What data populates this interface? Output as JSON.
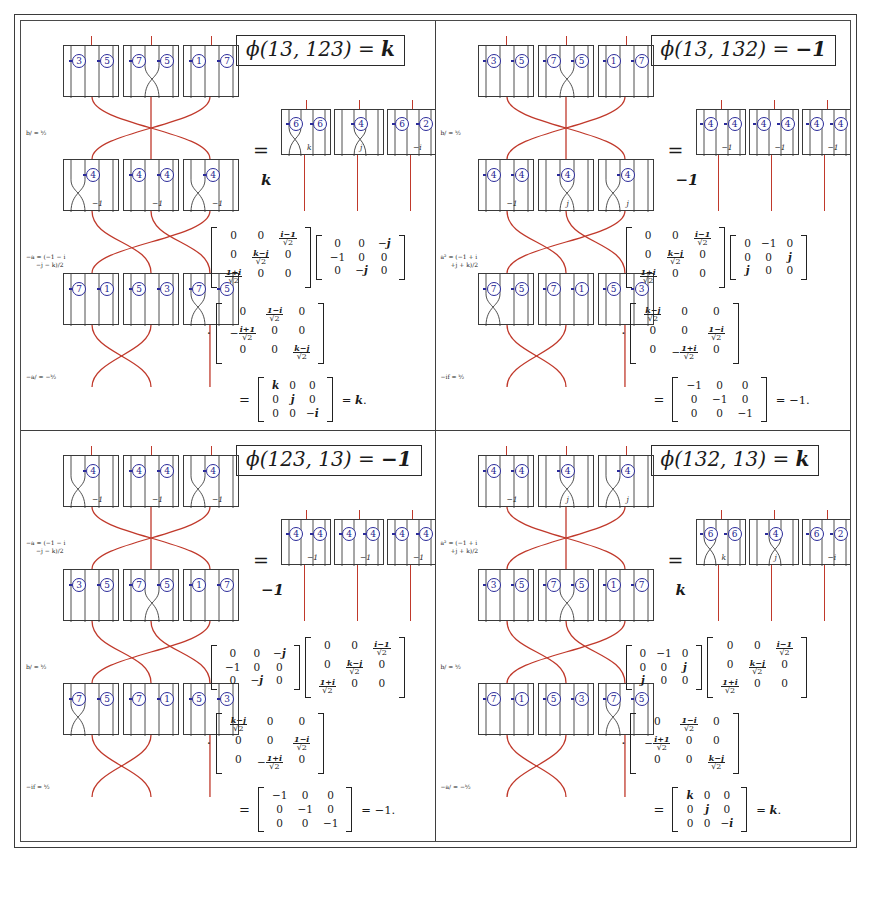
{
  "figure": {
    "type": "mathematical-braid-diagram-grid",
    "panel_count": 4,
    "colors": {
      "strand": "#c0392b",
      "box_outline": "#3a3a3a",
      "circle_number": "#1b1b8f",
      "frame": "#3b3b3b",
      "text": "#1a1a1a"
    }
  },
  "panels": [
    {
      "id": "top-left",
      "title_prefix": "ϕ(13, 123) = ",
      "title_value": "k",
      "annotations": [
        {
          "lines": [
            "b/ = ᵏ⁄₂"
          ]
        },
        {
          "lines": [
            "−a = (−1 − i",
            "−j − k)/2"
          ]
        },
        {
          "lines": [
            "−a/ = −ᵏ⁄₂"
          ]
        }
      ],
      "braid_rows": [
        {
          "boxes": [
            {
              "circles": [
                "3",
                "5"
              ],
              "label": "",
              "cross": false
            },
            {
              "circles": [
                "7",
                "5"
              ],
              "label": "",
              "cross": true
            },
            {
              "circles": [
                "1",
                "7"
              ],
              "label": "",
              "cross": false
            }
          ]
        },
        {
          "boxes": [
            {
              "circles": [
                "4"
              ],
              "label": "−1",
              "cross": true
            },
            {
              "circles": [
                "4",
                "4"
              ],
              "label": "−1",
              "cross": false
            },
            {
              "circles": [
                "4"
              ],
              "label": "−1",
              "cross": true
            }
          ]
        },
        {
          "boxes": [
            {
              "circles": [
                "7",
                "1"
              ],
              "label": "",
              "cross": false
            },
            {
              "circles": [
                "5",
                "3"
              ],
              "label": "",
              "cross": false
            },
            {
              "circles": [
                "7",
                "5"
              ],
              "label": "",
              "cross": true
            }
          ]
        }
      ],
      "equals": "=",
      "result_boxes": [
        {
          "circles": [
            "6",
            "6"
          ],
          "label": "k",
          "cross": true
        },
        {
          "circles": [
            "4"
          ],
          "label": "j",
          "cross": true
        },
        {
          "circles": [
            "6",
            "2"
          ],
          "label": "−i",
          "cross": false
        }
      ],
      "result_value": "k",
      "matrices": [
        {
          "rows": [
            [
              "0",
              "0",
              "FRAC:i−1"
            ],
            [
              "0",
              "FRAC:k−j",
              "0"
            ],
            [
              "FRAC:1+i",
              "0",
              "0"
            ]
          ]
        },
        {
          "rows": [
            [
              "0",
              "0",
              "−j"
            ],
            [
              "−1",
              "0",
              "0"
            ],
            [
              "0",
              "−j",
              "0"
            ]
          ]
        },
        {
          "rows": [
            [
              "0",
              "FRAC:1−i",
              "0"
            ],
            [
              "−FRAC:i+1",
              "0",
              "0"
            ],
            [
              "0",
              "0",
              "FRAC:k−j"
            ]
          ]
        }
      ],
      "final_matrix": {
        "rows": [
          [
            "k",
            "0",
            "0"
          ],
          [
            "0",
            "j",
            "0"
          ],
          [
            "0",
            "0",
            "−i"
          ]
        ]
      },
      "final_tail": "= k."
    },
    {
      "id": "top-right",
      "title_prefix": "ϕ(13, 132) = ",
      "title_value": "−1",
      "annotations": [
        {
          "lines": [
            "b/ = ᵏ⁄₂"
          ]
        },
        {
          "lines": [
            "a² = (−1 + i",
            "+j + k)/2"
          ]
        },
        {
          "lines": [
            "−if = ᵏ⁄₂"
          ]
        }
      ],
      "braid_rows": [
        {
          "boxes": [
            {
              "circles": [
                "3",
                "5"
              ],
              "label": "",
              "cross": false
            },
            {
              "circles": [
                "7",
                "5"
              ],
              "label": "",
              "cross": true
            },
            {
              "circles": [
                "1",
                "7"
              ],
              "label": "",
              "cross": false
            }
          ]
        },
        {
          "boxes": [
            {
              "circles": [
                "4",
                "4"
              ],
              "label": "−1",
              "cross": false
            },
            {
              "circles": [
                "4"
              ],
              "label": "j",
              "cross": true
            },
            {
              "circles": [
                "4"
              ],
              "label": "j",
              "cross": true
            }
          ]
        },
        {
          "boxes": [
            {
              "circles": [
                "7",
                "5"
              ],
              "label": "",
              "cross": true
            },
            {
              "circles": [
                "7",
                "1"
              ],
              "label": "",
              "cross": false
            },
            {
              "circles": [
                "5",
                "3"
              ],
              "label": "",
              "cross": false
            }
          ]
        }
      ],
      "equals": "=",
      "result_boxes": [
        {
          "circles": [
            "4",
            "4"
          ],
          "label": "−1",
          "cross": false
        },
        {
          "circles": [
            "4",
            "4"
          ],
          "label": "−1",
          "cross": false
        },
        {
          "circles": [
            "4",
            "4"
          ],
          "label": "−1",
          "cross": false
        }
      ],
      "result_value": "−1",
      "matrices": [
        {
          "rows": [
            [
              "0",
              "0",
              "FRAC:i−1"
            ],
            [
              "0",
              "FRAC:k−j",
              "0"
            ],
            [
              "FRAC:1+i",
              "0",
              "0"
            ]
          ]
        },
        {
          "rows": [
            [
              "0",
              "−1",
              "0"
            ],
            [
              "0",
              "0",
              "j"
            ],
            [
              "j",
              "0",
              "0"
            ]
          ]
        },
        {
          "rows": [
            [
              "FRAC:k−j",
              "0",
              "0"
            ],
            [
              "0",
              "0",
              "FRAC:1−i"
            ],
            [
              "0",
              "−FRAC:1+i",
              "0"
            ]
          ]
        }
      ],
      "final_matrix": {
        "rows": [
          [
            "−1",
            "0",
            "0"
          ],
          [
            "0",
            "−1",
            "0"
          ],
          [
            "0",
            "0",
            "−1"
          ]
        ]
      },
      "final_tail": "= −1."
    },
    {
      "id": "bottom-left",
      "title_prefix": "ϕ(123, 13) = ",
      "title_value": "−1",
      "annotations": [
        {
          "lines": [
            "−a = (−1 − i",
            "−j − k)/2"
          ]
        },
        {
          "lines": [
            "b/ = ᵏ⁄₂"
          ]
        },
        {
          "lines": [
            "−if = ᵏ⁄₂"
          ]
        }
      ],
      "braid_rows": [
        {
          "boxes": [
            {
              "circles": [
                "4"
              ],
              "label": "−1",
              "cross": true
            },
            {
              "circles": [
                "4",
                "4"
              ],
              "label": "−1",
              "cross": false
            },
            {
              "circles": [
                "4"
              ],
              "label": "−1",
              "cross": true
            }
          ]
        },
        {
          "boxes": [
            {
              "circles": [
                "3",
                "5"
              ],
              "label": "",
              "cross": false
            },
            {
              "circles": [
                "7",
                "5"
              ],
              "label": "",
              "cross": true
            },
            {
              "circles": [
                "1",
                "7"
              ],
              "label": "",
              "cross": false
            }
          ]
        },
        {
          "boxes": [
            {
              "circles": [
                "7",
                "5"
              ],
              "label": "",
              "cross": true
            },
            {
              "circles": [
                "7",
                "1"
              ],
              "label": "",
              "cross": false
            },
            {
              "circles": [
                "5",
                "3"
              ],
              "label": "",
              "cross": false
            }
          ]
        }
      ],
      "equals": "=",
      "result_boxes": [
        {
          "circles": [
            "4",
            "4"
          ],
          "label": "−1",
          "cross": false
        },
        {
          "circles": [
            "4",
            "4"
          ],
          "label": "−1",
          "cross": false
        },
        {
          "circles": [
            "4",
            "4"
          ],
          "label": "−1",
          "cross": false
        }
      ],
      "result_value": "−1",
      "matrices": [
        {
          "rows": [
            [
              "0",
              "0",
              "−j"
            ],
            [
              "−1",
              "0",
              "0"
            ],
            [
              "0",
              "−j",
              "0"
            ]
          ]
        },
        {
          "rows": [
            [
              "0",
              "0",
              "FRAC:i−1"
            ],
            [
              "0",
              "FRAC:k−j",
              "0"
            ],
            [
              "FRAC:1+i",
              "0",
              "0"
            ]
          ]
        },
        {
          "rows": [
            [
              "FRAC:k−j",
              "0",
              "0"
            ],
            [
              "0",
              "0",
              "FRAC:1−i"
            ],
            [
              "0",
              "−FRAC:1+i",
              "0"
            ]
          ]
        }
      ],
      "final_matrix": {
        "rows": [
          [
            "−1",
            "0",
            "0"
          ],
          [
            "0",
            "−1",
            "0"
          ],
          [
            "0",
            "0",
            "−1"
          ]
        ]
      },
      "final_tail": "= −1."
    },
    {
      "id": "bottom-right",
      "title_prefix": "ϕ(132, 13) = ",
      "title_value": "k",
      "annotations": [
        {
          "lines": [
            "a² = (−1 + i",
            "+j + k)/2"
          ]
        },
        {
          "lines": [
            "b/ = ᵏ⁄₂"
          ]
        },
        {
          "lines": [
            "−a/ = −ᵏ⁄₂"
          ]
        }
      ],
      "braid_rows": [
        {
          "boxes": [
            {
              "circles": [
                "4",
                "4"
              ],
              "label": "−1",
              "cross": false
            },
            {
              "circles": [
                "4"
              ],
              "label": "j",
              "cross": true
            },
            {
              "circles": [
                "4"
              ],
              "label": "j",
              "cross": true
            }
          ]
        },
        {
          "boxes": [
            {
              "circles": [
                "3",
                "5"
              ],
              "label": "",
              "cross": false
            },
            {
              "circles": [
                "7",
                "5"
              ],
              "label": "",
              "cross": true
            },
            {
              "circles": [
                "1",
                "7"
              ],
              "label": "",
              "cross": false
            }
          ]
        },
        {
          "boxes": [
            {
              "circles": [
                "7",
                "1"
              ],
              "label": "",
              "cross": false
            },
            {
              "circles": [
                "5",
                "3"
              ],
              "label": "",
              "cross": false
            },
            {
              "circles": [
                "7",
                "5"
              ],
              "label": "",
              "cross": true
            }
          ]
        }
      ],
      "equals": "=",
      "result_boxes": [
        {
          "circles": [
            "6",
            "6"
          ],
          "label": "k",
          "cross": true
        },
        {
          "circles": [
            "4"
          ],
          "label": "j",
          "cross": true
        },
        {
          "circles": [
            "6",
            "2"
          ],
          "label": "−i",
          "cross": false
        }
      ],
      "result_value": "k",
      "matrices": [
        {
          "rows": [
            [
              "0",
              "−1",
              "0"
            ],
            [
              "0",
              "0",
              "j"
            ],
            [
              "j",
              "0",
              "0"
            ]
          ]
        },
        {
          "rows": [
            [
              "0",
              "0",
              "FRAC:i−1"
            ],
            [
              "0",
              "FRAC:k−j",
              "0"
            ],
            [
              "FRAC:1+i",
              "0",
              "0"
            ]
          ]
        },
        {
          "rows": [
            [
              "0",
              "FRAC:1−i",
              "0"
            ],
            [
              "−FRAC:i+1",
              "0",
              "0"
            ],
            [
              "0",
              "0",
              "FRAC:k−j"
            ]
          ]
        }
      ],
      "final_matrix": {
        "rows": [
          [
            "k",
            "0",
            "0"
          ],
          [
            "0",
            "j",
            "0"
          ],
          [
            "0",
            "0",
            "−i"
          ]
        ]
      },
      "final_tail": "= k."
    }
  ]
}
